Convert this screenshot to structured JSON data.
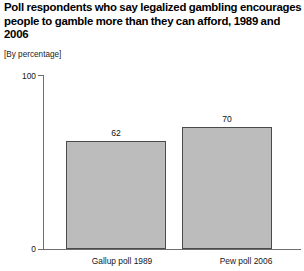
{
  "header": {
    "title": "Poll respondents who say legalized gambling encourages people to gamble more than they can afford, 1989 and 2006",
    "subtitle": "[By percentage]"
  },
  "chart_data": {
    "type": "bar",
    "title": "Poll respondents who say legalized gambling encourages people to gamble more than they can afford, 1989 and 2006",
    "subtitle": "[By percentage]",
    "categories": [
      "Gallup poll 1989",
      "Pew poll 2006"
    ],
    "values": [
      62,
      70
    ],
    "value_labels": [
      "62",
      "70"
    ],
    "xlabel": "",
    "ylabel": "",
    "ylim": [
      0,
      100
    ],
    "ytick_labels": [
      "0",
      "100"
    ],
    "ytick_values": [
      0,
      100
    ],
    "grid": false,
    "legend": false,
    "bar_fill_color": "#bcbcbc",
    "bar_border_color": "#4a4a4a",
    "axis_color": "#6e6e6e"
  }
}
